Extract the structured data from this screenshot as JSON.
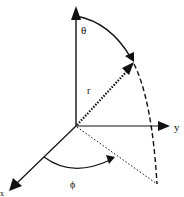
{
  "diagram": {
    "labels": {
      "theta": "θ",
      "r": "r",
      "y_axis": "y",
      "phi": "ϕ",
      "x_axis": "x"
    },
    "colors": {
      "stroke": "#111111",
      "background": "#ffffff"
    }
  }
}
